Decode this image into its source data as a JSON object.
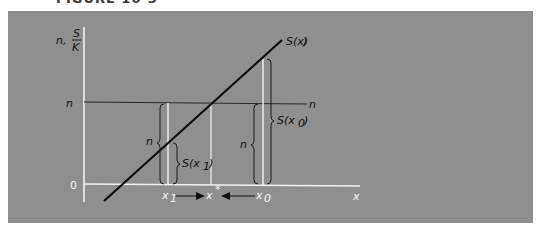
{
  "figure": {
    "caption": "FIGURE 10-3",
    "background_color": "#8f8f8f"
  },
  "axes": {
    "y_label_prefix": "n,",
    "y_label_numerator": "S",
    "y_label_denominator": "K",
    "origin_label": "0",
    "x_label": "x",
    "n_tick_label": "n",
    "n_line_label": "n"
  },
  "curve": {
    "label": "S(x)"
  },
  "brackets": {
    "x1_n_label": "n",
    "x1_s_label": "S(x",
    "x1_s_sub": "1",
    "x0_n_label": "n",
    "x0_s_label": "S(x",
    "x0_s_sub": "0"
  },
  "x_markers": {
    "x1": "x",
    "x1_sub": "1",
    "xstar": "x",
    "xstar_sup": "*",
    "x0": "x",
    "x0_sub": "0"
  }
}
